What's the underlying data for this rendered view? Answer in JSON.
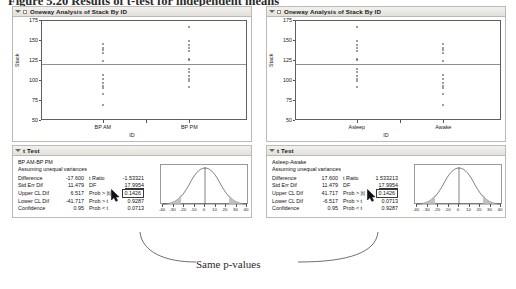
{
  "caption": "Figure 5.20   Results of t-test for independent means",
  "reports": [
    {
      "id": "left",
      "oneway": {
        "header": "Oneway Analysis of Stack By ID",
        "ylabel": "Stack",
        "xlabel": "ID",
        "yticks": [
          "175",
          "150",
          "125",
          "100",
          "75",
          "50"
        ],
        "groups": [
          "BP AM",
          "BP PM"
        ],
        "mean_line": 120.5
      },
      "ttest": {
        "header": "t Test",
        "comparison": "BP AM-BP PM",
        "assumption": "Assuming unequal variances",
        "rows": [
          {
            "label": "Difference",
            "value": "-17.600",
            "label2": "t Ratio",
            "value2": "-1.53321",
            "style2": "plain"
          },
          {
            "label": "Std Err Dif",
            "value": "11.479",
            "label2": "DF",
            "value2": "17.9954",
            "style2": "underline"
          },
          {
            "label": "Upper CL Dif",
            "value": "6.517",
            "label2": "Prob > |t|",
            "value2": "0.1426",
            "style2": "highlight"
          },
          {
            "label": "Lower CL Dif",
            "value": "-41.717",
            "label2": "Prob > t",
            "value2": "0.9287",
            "style2": "plain"
          },
          {
            "label": "Confidence",
            "value": "0.95",
            "label2": "Prob < t",
            "value2": "0.0713",
            "style2": "plain"
          }
        ],
        "curve_ticks": [
          "-40",
          "-30",
          "-20",
          "-10",
          "0",
          "10",
          "20",
          "30",
          "40"
        ]
      }
    },
    {
      "id": "right",
      "oneway": {
        "header": "Oneway Analysis of Stack By ID",
        "ylabel": "Stack",
        "xlabel": "ID",
        "yticks": [
          "175",
          "150",
          "125",
          "100",
          "75",
          "50"
        ],
        "groups": [
          "Asleep",
          "Awake"
        ],
        "mean_line": 120.5
      },
      "ttest": {
        "header": "t Test",
        "comparison": "Asleep-Awake",
        "assumption": "Assuming unequal variances",
        "rows": [
          {
            "label": "Difference",
            "value": "17.600",
            "label2": "t Ratio",
            "value2": "1.533213",
            "style2": "plain"
          },
          {
            "label": "Std Err Dif",
            "value": "11.479",
            "label2": "DF",
            "value2": "17.9954",
            "style2": "underline"
          },
          {
            "label": "Upper CL Dif",
            "value": "41.717",
            "label2": "Prob > |t|",
            "value2": "0.1426",
            "style2": "highlight"
          },
          {
            "label": "Lower CL Dif",
            "value": "-6.517",
            "label2": "Prob > t",
            "value2": "0.0713",
            "style2": "plain"
          },
          {
            "label": "Confidence",
            "value": "0.95",
            "label2": "Prob < t",
            "value2": "0.9287",
            "style2": "plain"
          }
        ],
        "curve_ticks": [
          "-40",
          "-30",
          "-20",
          "-10",
          "0",
          "10",
          "20",
          "30",
          "40"
        ]
      }
    }
  ],
  "annotation": {
    "text": "Same p-values"
  },
  "colors": {
    "panel_border": "#bdbab4",
    "panel_header_bg": "#ebe9e4",
    "plot_border": "#5f5f5f",
    "point_stroke": "#5a5a5a",
    "mean_line": "#8e8e8e",
    "curve_fill": "#b8b8b8",
    "text": "#111111"
  },
  "chart_data": [
    {
      "type": "scatter",
      "title": "Oneway Analysis of Stack By ID",
      "xlabel": "ID",
      "ylabel": "Stack",
      "ylim": [
        50,
        175
      ],
      "yticks": [
        175,
        150,
        125,
        100,
        75,
        50
      ],
      "categories": [
        "BP AM",
        "BP PM"
      ],
      "grid": false,
      "mean_line": 120.5,
      "series": [
        {
          "name": "BP AM",
          "values": [
            148,
            143,
            140,
            137,
            126,
            109,
            103,
            99,
            95,
            92,
            85,
            70
          ]
        },
        {
          "name": "BP PM",
          "values": [
            170,
            152,
            147,
            143,
            139,
            129,
            128,
            116,
            112,
            108,
            104,
            101,
            94
          ]
        }
      ]
    },
    {
      "type": "scatter",
      "title": "Oneway Analysis of Stack By ID",
      "xlabel": "ID",
      "ylabel": "Stack",
      "ylim": [
        50,
        175
      ],
      "yticks": [
        175,
        150,
        125,
        100,
        75,
        50
      ],
      "categories": [
        "Asleep",
        "Awake"
      ],
      "grid": false,
      "mean_line": 120.5,
      "series": [
        {
          "name": "Asleep",
          "values": [
            170,
            152,
            147,
            143,
            139,
            129,
            128,
            116,
            112,
            108,
            104,
            101,
            94
          ]
        },
        {
          "name": "Awake",
          "values": [
            148,
            143,
            140,
            137,
            126,
            109,
            103,
            99,
            95,
            92,
            85,
            70
          ]
        }
      ]
    },
    {
      "type": "line",
      "title": "t distribution reference",
      "xlabel": "",
      "ylabel": "",
      "xlim": [
        -45,
        45
      ],
      "xticks": [
        -40,
        -30,
        -20,
        -10,
        0,
        10,
        20,
        30,
        40
      ],
      "grid": false,
      "shaded_tails": [
        -45,
        -23,
        23,
        45
      ],
      "center_line": 0
    }
  ]
}
